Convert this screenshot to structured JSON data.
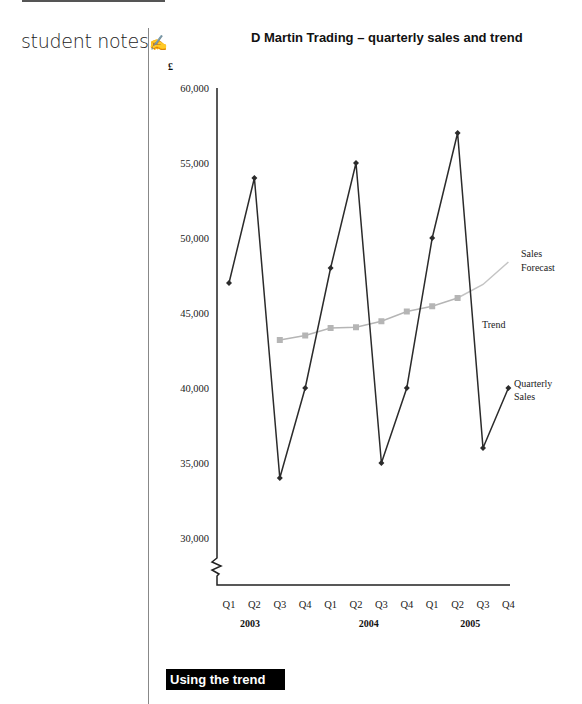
{
  "sidebar": {
    "student_notes_label": "student notes",
    "pen_icon": "✍"
  },
  "section_banner": "Using the trend",
  "chart_data": {
    "type": "line",
    "title": "D Martin Trading – quarterly sales and trend",
    "ylabel": "£",
    "xlabel": "",
    "ylim": [
      28000,
      60000
    ],
    "y_axis_break": true,
    "yticks": [
      30000,
      35000,
      40000,
      45000,
      50000,
      55000,
      60000
    ],
    "ytick_labels": [
      "30,000",
      "35,000",
      "40,000",
      "45,000",
      "50,000",
      "55,000",
      "60,000"
    ],
    "categories": [
      "Q1",
      "Q2",
      "Q3",
      "Q4",
      "Q1",
      "Q2",
      "Q3",
      "Q4",
      "Q1",
      "Q2",
      "Q3",
      "Q4"
    ],
    "year_labels": [
      {
        "label": "2003",
        "center_index": 1.5
      },
      {
        "label": "2004",
        "center_index": 5.5
      },
      {
        "label": "2005",
        "center_index": 9.5
      }
    ],
    "grid": false,
    "series": [
      {
        "name": "Quarterly Sales",
        "marker": "diamond",
        "color": "#2b2b2b",
        "values": [
          47000,
          54000,
          34000,
          40000,
          48000,
          55000,
          35000,
          40000,
          50000,
          57000,
          36000,
          40000
        ]
      },
      {
        "name": "Trend",
        "marker": "square",
        "color": "#b5b5b5",
        "values": [
          null,
          null,
          43200,
          43500,
          44000,
          44050,
          44450,
          45100,
          45450,
          46000,
          null,
          null
        ]
      },
      {
        "name": "Sales Forecast",
        "marker": "none",
        "color": "#c4c4c4",
        "values": [
          null,
          null,
          null,
          null,
          null,
          null,
          null,
          null,
          null,
          46000,
          46900,
          48400
        ]
      }
    ],
    "annotations": [
      {
        "text": "Sales",
        "series": "Sales Forecast"
      },
      {
        "text": "Forecast",
        "series": "Sales Forecast"
      },
      {
        "text": "Trend",
        "series": "Trend"
      },
      {
        "text": "Quarterly",
        "series": "Quarterly Sales"
      },
      {
        "text": "Sales",
        "series": "Quarterly Sales"
      }
    ]
  }
}
